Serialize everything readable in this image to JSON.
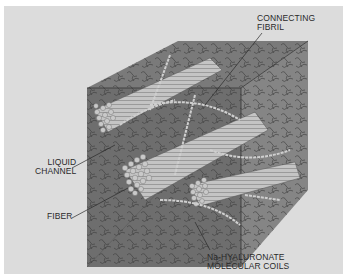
{
  "diagram": {
    "labels": {
      "connecting_fibril": "CONNECTING\nFIBRIL",
      "liquid_channel": "LIQUID\nCHANNEL",
      "fiber": "FIBER",
      "molecular_coils": "Na-HYALURONATE\nMOLECULAR COILS"
    },
    "colors": {
      "background": "#dcdcdc",
      "border": "#ffffff",
      "cube_front": "#6e6e6e",
      "cube_top": "#7a7a7a",
      "cube_right": "#858585",
      "fiber": "#bdbdbd",
      "text": "#2a2a2a"
    }
  }
}
